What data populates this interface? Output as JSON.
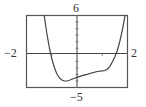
{
  "chart_data": {
    "type": "line",
    "title": "",
    "xlabel": "",
    "ylabel": "",
    "xlim": [
      -2,
      2
    ],
    "ylim": [
      -5,
      6
    ],
    "grid": false,
    "tick_labels": {
      "x_min": "−2",
      "x_max": "2",
      "y_max": "6",
      "y_min": "−5"
    },
    "series": [
      {
        "name": "f(x)",
        "x": [
          -1.3,
          -1.2,
          -1.1,
          -1.0,
          -0.9,
          -0.8,
          -0.7,
          -0.6,
          -0.5,
          -0.4,
          -0.3,
          -0.2,
          -0.1,
          0.0,
          0.2,
          0.4,
          0.6,
          0.8,
          1.0,
          1.1,
          1.2,
          1.3,
          1.4,
          1.5,
          1.6,
          1.7,
          1.8,
          1.9
        ],
        "y": [
          6.0,
          3.4,
          1.2,
          -0.6,
          -1.9,
          -2.9,
          -3.5,
          -3.85,
          -4.0,
          -4.0,
          -3.9,
          -3.75,
          -3.6,
          -3.45,
          -3.2,
          -3.0,
          -2.75,
          -2.55,
          -2.45,
          -2.4,
          -2.2,
          -1.8,
          -1.1,
          -0.3,
          0.7,
          2.1,
          3.8,
          6.0
        ]
      }
    ],
    "x_intercepts": [
      -1.05,
      1.55
    ]
  },
  "labels": {
    "x_min": "−2",
    "x_max": "2",
    "y_max": "6",
    "y_min": "−5"
  }
}
